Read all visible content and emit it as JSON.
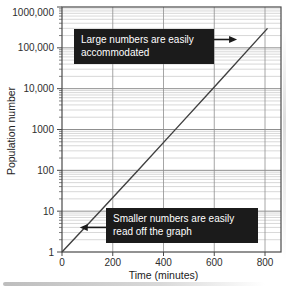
{
  "figure": {
    "colors": {
      "grid_minor": "#bdbdbd",
      "grid_major": "#8f8f8f",
      "frame": "#4a4a4a",
      "data_line": "#404040",
      "tick": "#4a4a4a",
      "label_text": "#2e2e2e",
      "annotation_bg": "#1b1b1b",
      "annotation_text": "#ffffff",
      "arrow": "#1b1b1b"
    },
    "annotations": [
      {
        "line1": "Large numbers are easily",
        "line2": "accommodated"
      },
      {
        "line1": "Smaller numbers are easily",
        "line2": "read off the graph"
      }
    ]
  },
  "chart_data": {
    "type": "line",
    "title": "",
    "xlabel": "Time (minutes)",
    "ylabel": "Population number",
    "x_axis": {
      "label": "Time (minutes)",
      "ticks": [
        0,
        200,
        400,
        600,
        800
      ],
      "range": [
        0,
        860
      ]
    },
    "y_axis": {
      "label": "Population number",
      "scale": "log",
      "tick_values": [
        1,
        10,
        100,
        1000,
        10000,
        100000,
        1000000
      ],
      "tick_labels": [
        "1",
        "10",
        "100",
        "1000",
        "10,000",
        "100,000",
        "1000,000"
      ],
      "range": [
        1,
        1000000
      ]
    },
    "grid": "log grid: horizontal minor lines at 2-9 within each decade, heavier line at each decade, vertical gridlines every 200 minutes",
    "series": [
      {
        "name": "population growth (straight line on semi-log axes)",
        "points": [
          {
            "x": 0,
            "y": 1
          },
          {
            "x": 150,
            "y": 10
          },
          {
            "x": 300,
            "y": 100
          },
          {
            "x": 450,
            "y": 1050
          },
          {
            "x": 600,
            "y": 11000
          },
          {
            "x": 810,
            "y": 300000
          }
        ]
      }
    ],
    "annotations": [
      {
        "text": "Large numbers are easily accommodated",
        "arrow_points_to": {
          "x": 690,
          "y": 160000
        }
      },
      {
        "text": "Smaller numbers are easily read off the graph",
        "arrow_points_to": {
          "x": 70,
          "y": 4
        }
      }
    ]
  }
}
